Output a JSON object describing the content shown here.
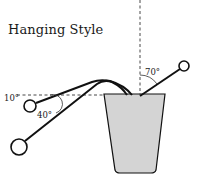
{
  "title": "Hanging Style",
  "colors": {
    "stroke": "#111111",
    "pot_fill": "#d4d4d4",
    "background": "#ffffff"
  },
  "angles": {
    "vertical_right": "70°",
    "left_upper": "10°",
    "left_lower": "40°"
  },
  "elements": {
    "pot": "pot",
    "hanger_right": "hanger-right",
    "hanger_left_short": "hanger-left-short",
    "hanger_left_long": "hanger-left-long",
    "reference_vertical": "vertical-reference-line",
    "reference_horizontal": "horizontal-reference-line"
  }
}
